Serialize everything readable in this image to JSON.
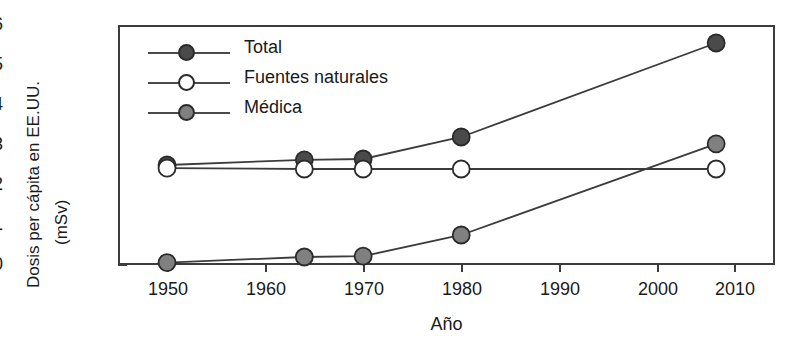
{
  "chart_data": {
    "type": "line",
    "title": "",
    "xlabel": "Año",
    "ylabel_line1": "Dosis per cápita en EE.UU.",
    "ylabel_line2": "(mSv)",
    "xlim": [
      1945,
      2012
    ],
    "ylim": [
      0,
      6
    ],
    "xticks": [
      1950,
      1960,
      1970,
      1980,
      1990,
      2000,
      2010
    ],
    "xtick_labels": [
      "1950",
      "1960",
      "1970",
      "1980",
      "1990",
      "2000",
      "2010"
    ],
    "yticks": [
      0,
      1,
      2,
      3,
      4,
      5,
      6
    ],
    "ytick_labels": [
      "0",
      "1",
      "2",
      "3",
      "4",
      "5",
      "6"
    ],
    "grid": false,
    "legend_position": "upper-left-inside",
    "x": [
      1950,
      1964,
      1970,
      1980,
      2006
    ],
    "series": [
      {
        "name": "Total",
        "marker": "filled-circle",
        "marker_color": "#4a4a4a",
        "line_color": "#3c3c3c",
        "values": [
          2.5,
          2.63,
          2.65,
          3.2,
          5.55
        ]
      },
      {
        "name": "Fuentes naturales",
        "marker": "open-circle",
        "marker_color": "#ffffff",
        "line_color": "#3c3c3c",
        "values": [
          2.42,
          2.4,
          2.4,
          2.4,
          2.4
        ]
      },
      {
        "name": "Médica",
        "marker": "filled-circle",
        "marker_color": "#808080",
        "line_color": "#3c3c3c",
        "values": [
          0.06,
          0.2,
          0.22,
          0.75,
          3.03
        ]
      }
    ]
  },
  "legend": {
    "items": [
      {
        "label": "Total"
      },
      {
        "label": "Fuentes naturales"
      },
      {
        "label": "Médica"
      }
    ]
  },
  "axes": {
    "y_tick_0": "0",
    "y_tick_1": "1",
    "y_tick_2": "2",
    "y_tick_3": "3",
    "y_tick_4": "4",
    "y_tick_5": "5",
    "y_tick_6": "6",
    "x_tick_1950": "1950",
    "x_tick_1960": "1960",
    "x_tick_1970": "1970",
    "x_tick_1980": "1980",
    "x_tick_1990": "1990",
    "x_tick_2000": "2000",
    "x_tick_2010": "2010"
  }
}
